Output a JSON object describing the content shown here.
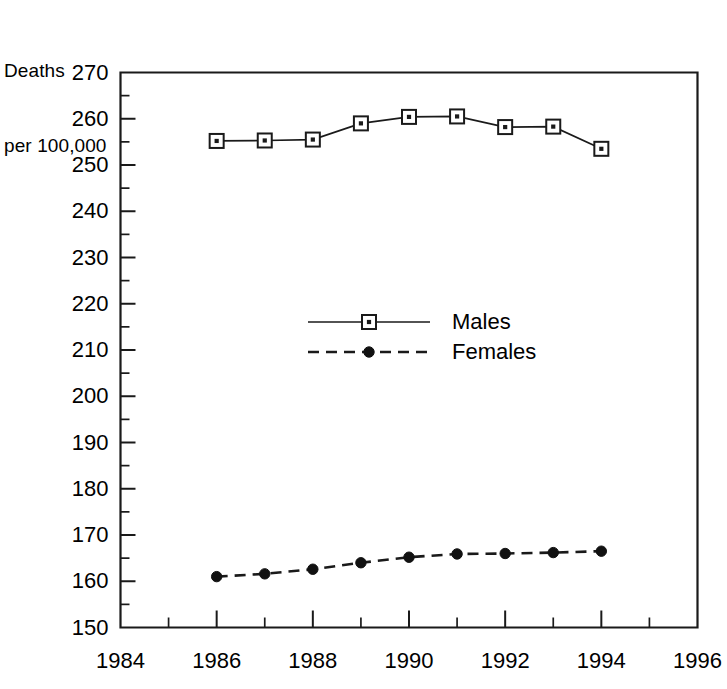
{
  "chart_data": {
    "type": "line",
    "title": "",
    "subtitle": "",
    "ylabel_line1": "Deaths",
    "ylabel_line2": "per 100,000",
    "xlabel": "",
    "x": [
      1986,
      1987,
      1988,
      1989,
      1990,
      1991,
      1992,
      1993,
      1994
    ],
    "series": [
      {
        "name": "Males",
        "marker": "open-square-with-dot",
        "linestyle": "solid",
        "values": [
          255.2,
          255.3,
          255.5,
          259.0,
          260.4,
          260.5,
          258.2,
          258.3,
          253.5
        ]
      },
      {
        "name": "Females",
        "marker": "filled-circle",
        "linestyle": "dashed",
        "values": [
          161.0,
          161.6,
          162.6,
          164.0,
          165.2,
          165.9,
          166.0,
          166.2,
          166.5
        ]
      }
    ],
    "xlim": [
      1984,
      1996
    ],
    "ylim": [
      150,
      270
    ],
    "x_tick_labels": [
      "1984",
      "1986",
      "1988",
      "1990",
      "1992",
      "1994",
      "1996"
    ],
    "x_tick_values": [
      1984,
      1986,
      1988,
      1990,
      1992,
      1994,
      1996
    ],
    "x_minor_tick_values": [
      1985,
      1987,
      1989,
      1991,
      1993,
      1995
    ],
    "y_tick_labels": [
      "270",
      "260",
      "250",
      "240",
      "230",
      "220",
      "210",
      "200",
      "190",
      "180",
      "170",
      "160",
      "150"
    ],
    "y_tick_values": [
      270,
      260,
      250,
      240,
      230,
      220,
      210,
      200,
      190,
      180,
      170,
      160,
      150
    ],
    "y_minor_tick_values": [
      265,
      255,
      245,
      235,
      225,
      215,
      205,
      195,
      185,
      175,
      165,
      155
    ],
    "grid": false,
    "legend_position": "center",
    "legend_entries": [
      "Males",
      "Females"
    ],
    "line_color": "#1a1a1a",
    "background_color": "#ffffff"
  }
}
